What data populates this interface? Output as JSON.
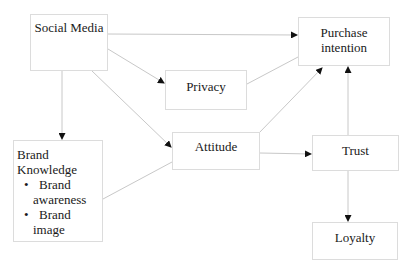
{
  "diagram": {
    "nodes": {
      "social_media": {
        "label": "Social Media"
      },
      "purchase_intention": {
        "label_line1": "Purchase",
        "label_line2": "intention"
      },
      "privacy": {
        "label": "Privacy"
      },
      "attitude": {
        "label": "Attitude"
      },
      "brand_knowledge": {
        "label_line1": "Brand",
        "label_line2": "Knowledge",
        "items": [
          {
            "bullet": "•",
            "line1": "Brand",
            "line2": "awareness"
          },
          {
            "bullet": "•",
            "line1": "Brand",
            "line2": "image"
          }
        ]
      },
      "trust": {
        "label": "Trust"
      },
      "loyalty": {
        "label": "Loyalty"
      }
    },
    "edges": [
      {
        "from": "Social Media",
        "to": "Purchase intention"
      },
      {
        "from": "Social Media",
        "to": "Privacy"
      },
      {
        "from": "Social Media",
        "to": "Attitude"
      },
      {
        "from": "Social Media",
        "to": "Brand Knowledge"
      },
      {
        "from": "Privacy",
        "to": "Purchase intention"
      },
      {
        "from": "Attitude",
        "to": "Purchase intention"
      },
      {
        "from": "Brand Knowledge",
        "to": "Attitude"
      },
      {
        "from": "Attitude",
        "to": "Trust"
      },
      {
        "from": "Trust",
        "to": "Purchase intention"
      },
      {
        "from": "Trust",
        "to": "Loyalty"
      }
    ],
    "colors": {
      "line": "#c8c8c8",
      "border": "#dcdcdc",
      "arrow": "#111111",
      "text": "#1a1a1a"
    }
  }
}
